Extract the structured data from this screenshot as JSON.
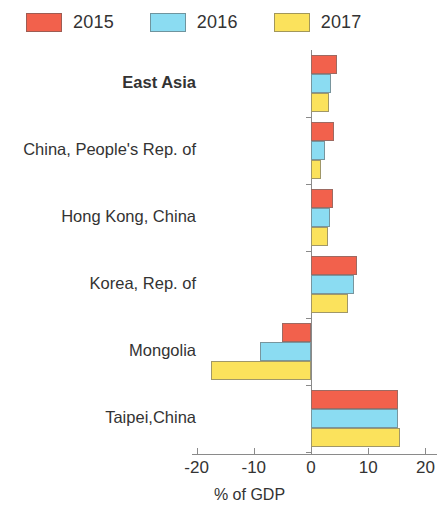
{
  "legend": {
    "position": "top-left",
    "entries": [
      {
        "label": "2015",
        "color": "#F2614C"
      },
      {
        "label": "2016",
        "color": "#8BDCF2"
      },
      {
        "label": "2017",
        "color": "#FBE25C"
      }
    ]
  },
  "axis": {
    "x_title": "% of GDP",
    "x_ticks": [
      "-20",
      "-10",
      "0",
      "10",
      "20"
    ],
    "x_tick_values": [
      -20,
      -10,
      0,
      10,
      20
    ],
    "x_min": -20,
    "x_max": 20
  },
  "chart_data": {
    "type": "bar",
    "orientation": "horizontal",
    "title": "",
    "subtitle": "",
    "xlabel": "% of GDP",
    "ylabel": "",
    "xlim": [
      -20,
      20
    ],
    "grid": false,
    "legend_position": "top-left",
    "categories": [
      "East Asia",
      "China, People's Rep. of",
      "Hong Kong, China",
      "Korea, Rep. of",
      "Mongolia",
      "Taipei,China"
    ],
    "category_emphasis": [
      true,
      false,
      false,
      false,
      false,
      false
    ],
    "series": [
      {
        "name": "2015",
        "color": "#F2614C",
        "values": [
          4.6,
          4.0,
          3.8,
          8.1,
          -5.1,
          15.2
        ]
      },
      {
        "name": "2016",
        "color": "#8BDCF2",
        "values": [
          3.5,
          2.4,
          3.3,
          7.6,
          -9.0,
          15.2
        ]
      },
      {
        "name": "2017",
        "color": "#FBE25C",
        "values": [
          3.2,
          1.8,
          2.9,
          6.4,
          -17.5,
          15.6
        ]
      }
    ]
  }
}
